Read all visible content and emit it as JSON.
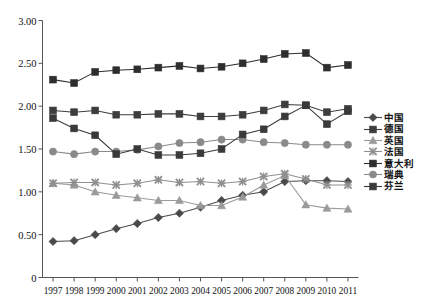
{
  "chart_data": {
    "type": "line",
    "title": "",
    "subtitle": "",
    "xlabel": "",
    "ylabel": "",
    "categories": [
      "1997",
      "1998",
      "1999",
      "2000",
      "2001",
      "2002",
      "2003",
      "2004",
      "2005",
      "2006",
      "2007",
      "2008",
      "2009",
      "2010",
      "2011"
    ],
    "x": [
      1997,
      1998,
      1999,
      2000,
      2001,
      2002,
      2003,
      2004,
      2005,
      2006,
      2007,
      2008,
      2009,
      2010,
      2011
    ],
    "ylim": [
      0,
      3.0
    ],
    "yticks": [
      "0",
      "0.50",
      "1.00",
      "1.50",
      "2.00",
      "2.50",
      "3.00"
    ],
    "ytick_values": [
      0,
      0.5,
      1.0,
      1.5,
      2.0,
      2.5,
      3.0
    ],
    "grid": false,
    "legend_position": "right",
    "series": [
      {
        "name": "中国",
        "marker": "diamond",
        "color": "#4a4a4a",
        "values": [
          0.42,
          0.43,
          0.5,
          0.57,
          0.63,
          0.7,
          0.75,
          0.82,
          0.9,
          0.96,
          1.0,
          1.12,
          1.13,
          1.13,
          1.12
        ]
      },
      {
        "name": "德国",
        "marker": "square",
        "color": "#3d3d3d",
        "values": [
          1.95,
          1.93,
          1.95,
          1.9,
          1.9,
          1.91,
          1.91,
          1.88,
          1.88,
          1.9,
          1.95,
          2.02,
          2.01,
          1.93,
          1.97
        ]
      },
      {
        "name": "英国",
        "marker": "triangle",
        "color": "#9a9a9a",
        "values": [
          1.1,
          1.08,
          1.0,
          0.96,
          0.93,
          0.9,
          0.9,
          0.84,
          0.84,
          0.94,
          1.08,
          1.19,
          0.85,
          0.81,
          0.8
        ]
      },
      {
        "name": "法国",
        "marker": "x",
        "color": "#8f8f8f",
        "values": [
          1.1,
          1.11,
          1.11,
          1.08,
          1.1,
          1.14,
          1.11,
          1.12,
          1.1,
          1.12,
          1.18,
          1.21,
          1.15,
          1.08,
          1.08
        ]
      },
      {
        "name": "意大利",
        "marker": "square",
        "color": "#2e2e2e",
        "values": [
          2.31,
          2.27,
          2.4,
          2.42,
          2.43,
          2.45,
          2.47,
          2.44,
          2.46,
          2.5,
          2.55,
          2.61,
          2.62,
          2.45,
          2.48
        ]
      },
      {
        "name": "瑞典",
        "marker": "circle",
        "color": "#8a8a8a",
        "values": [
          1.47,
          1.44,
          1.47,
          1.47,
          1.49,
          1.53,
          1.57,
          1.58,
          1.61,
          1.61,
          1.58,
          1.57,
          1.55,
          1.55,
          1.55
        ]
      },
      {
        "name": "芬兰",
        "marker": "square",
        "color": "#3a3a3a",
        "values": [
          1.86,
          1.74,
          1.66,
          1.44,
          1.5,
          1.43,
          1.43,
          1.45,
          1.5,
          1.67,
          1.73,
          1.88,
          2.01,
          1.79,
          1.94
        ]
      }
    ]
  },
  "legend": {
    "items": [
      {
        "label": "中国",
        "marker": "diamond",
        "color": "#4a4a4a"
      },
      {
        "label": "德国",
        "marker": "square",
        "color": "#3d3d3d"
      },
      {
        "label": "英国",
        "marker": "triangle",
        "color": "#9a9a9a"
      },
      {
        "label": "法国",
        "marker": "x",
        "color": "#8f8f8f"
      },
      {
        "label": "意大利",
        "marker": "square",
        "color": "#2e2e2e"
      },
      {
        "label": "瑞典",
        "marker": "circle",
        "color": "#8a8a8a"
      },
      {
        "label": "芬兰",
        "marker": "square",
        "color": "#3a3a3a"
      }
    ]
  },
  "caption": {
    "text": ""
  }
}
